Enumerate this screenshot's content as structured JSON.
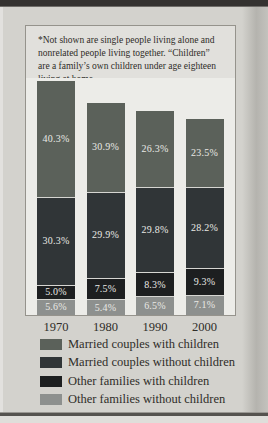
{
  "note": {
    "lines": [
      "*Not shown are single people living alone and",
      "nonrelated people living together. “Children”",
      "are a family’s own children under age eighteen",
      "living at home."
    ]
  },
  "chart_data": {
    "type": "bar",
    "stacked": true,
    "categories": [
      "1970",
      "1980",
      "1990",
      "2000"
    ],
    "series": [
      {
        "name": "Married couples with children",
        "color": "#5b615a",
        "values": [
          40.3,
          30.9,
          26.3,
          23.5
        ],
        "labels": [
          "40.3%",
          "30.9%",
          "26.3%",
          "23.5%"
        ]
      },
      {
        "name": "Married couples without children",
        "color": "#303537",
        "values": [
          30.3,
          29.9,
          29.8,
          28.2
        ],
        "labels": [
          "30.3%",
          "29.9%",
          "29.8%",
          "28.2%"
        ]
      },
      {
        "name": "Other families with children",
        "color": "#1d1f20",
        "values": [
          5.0,
          7.5,
          8.3,
          9.3
        ],
        "labels": [
          "5.0%",
          "7.5%",
          "8.3%",
          "9.3%"
        ]
      },
      {
        "name": "Other families without children",
        "color": "#8d908e",
        "values": [
          5.6,
          5.4,
          6.5,
          7.1
        ],
        "labels": [
          "5.6%",
          "5.4%",
          "6.5%",
          "7.1%"
        ]
      }
    ],
    "value_labels_shown": true,
    "unit": "%",
    "legend_position": "bottom",
    "axis": {
      "gridlines": false,
      "y_axis_shown": false
    }
  }
}
